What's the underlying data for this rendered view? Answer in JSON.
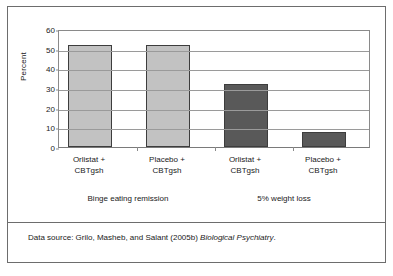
{
  "chart_data": {
    "type": "bar",
    "title": "",
    "xlabel": "",
    "ylabel": "Percent",
    "ylim": [
      0,
      60
    ],
    "ytick_step": 10,
    "yticks": [
      0,
      10,
      20,
      30,
      40,
      50,
      60
    ],
    "grid": true,
    "legend": "none",
    "categories": [
      "Orlistat +\nCBTgsh",
      "Placebo +\nCBTgsh",
      "Orlistat +\nCBTgsh",
      "Placebo +\nCBTgsh"
    ],
    "values": [
      52,
      52,
      32,
      7.5
    ],
    "bar_colors": [
      "#c2c2c2",
      "#c2c2c2",
      "#595959",
      "#595959"
    ],
    "groups": [
      {
        "label": "Binge eating remission",
        "categories": [
          0,
          1
        ]
      },
      {
        "label": "5% weight loss",
        "categories": [
          2,
          3
        ]
      }
    ]
  },
  "axes": {
    "y_title": "Percent",
    "y_tick_labels": [
      "60",
      "50",
      "40",
      "30",
      "20",
      "10",
      "0"
    ]
  },
  "categories": [
    {
      "line1": "Orlistat +",
      "line2": "CBTgsh"
    },
    {
      "line1": "Placebo +",
      "line2": "CBTgsh"
    },
    {
      "line1": "Orlistat +",
      "line2": "CBTgsh"
    },
    {
      "line1": "Placebo +",
      "line2": "CBTgsh"
    }
  ],
  "groups": [
    {
      "label": "Binge eating remission"
    },
    {
      "label": "5% weight loss"
    }
  ],
  "source": {
    "prefix": "Data source: Grilo, Masheb, and Salant (2005b) ",
    "journal": "Biological Psychiatry",
    "suffix": "."
  },
  "colors": {
    "bar_light": "#c2c2c2",
    "bar_dark": "#595959",
    "bar_outline": "#3d3d3d",
    "gridline": "#9a9a9a",
    "frame": "#6d6d6d",
    "text": "#1a1a1a",
    "background": "#ffffff"
  }
}
